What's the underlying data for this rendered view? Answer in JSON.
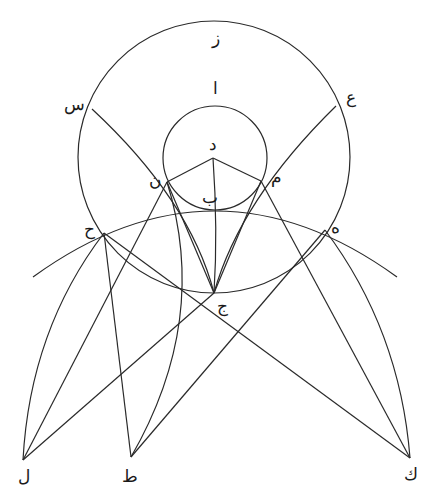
{
  "diagram": {
    "type": "geometric-construction",
    "stroke_color": "#2a2a2a",
    "background": "#ffffff",
    "points": {
      "Z": {
        "label": "ز",
        "x": 214,
        "y": 21,
        "lx": 216,
        "ly": 44
      },
      "A": {
        "label": "ا",
        "x": 215,
        "y": 106,
        "lx": 215,
        "ly": 94
      },
      "S": {
        "label": "س",
        "x": 92,
        "y": 109,
        "lx": 74,
        "ly": 110
      },
      "AYN": {
        "label": "ع",
        "x": 336,
        "y": 106,
        "lx": 351,
        "ly": 103
      },
      "D": {
        "label": "د",
        "x": 213,
        "y": 158,
        "lx": 213,
        "ly": 150
      },
      "N": {
        "label": "ن",
        "x": 167,
        "y": 182,
        "lx": 155,
        "ly": 186
      },
      "M": {
        "label": "م",
        "x": 261,
        "y": 181,
        "lx": 276,
        "ly": 183
      },
      "B": {
        "label": "ب",
        "x": 215,
        "y": 210,
        "lx": 210,
        "ly": 203
      },
      "H": {
        "label": "ح",
        "x": 104,
        "y": 233,
        "lx": 89,
        "ly": 235
      },
      "HE": {
        "label": "ه",
        "x": 325,
        "y": 230,
        "lx": 335,
        "ly": 233
      },
      "J": {
        "label": "ج",
        "x": 214,
        "y": 293,
        "lx": 222,
        "ly": 312
      },
      "L": {
        "label": "ل",
        "x": 23,
        "y": 460,
        "lx": 24,
        "ly": 482
      },
      "T": {
        "label": "ط",
        "x": 131,
        "y": 457,
        "lx": 130,
        "ly": 482
      },
      "K": {
        "label": "ك",
        "x": 410,
        "y": 458,
        "lx": 411,
        "ly": 480
      }
    },
    "circles": [
      {
        "name": "outer-circle",
        "cx": 214,
        "cy": 157,
        "r": 136
      },
      {
        "name": "inner-circle",
        "cx": 215,
        "cy": 158,
        "r": 52
      }
    ],
    "arcs": [
      {
        "name": "arc-big-horizontal",
        "d": "M33,277 Q215,145 397,277"
      },
      {
        "name": "arc-s-n-j",
        "d": "M92,109 Q190,200 214,293"
      },
      {
        "name": "arc-ayn-m-j",
        "d": "M336,106 Q240,200 214,293"
      },
      {
        "name": "arc-d-j",
        "d": "M213,158 Q218,230 214,293"
      },
      {
        "name": "arc-h-l",
        "d": "M104,233 Q30,330 23,460"
      },
      {
        "name": "arc-he-k",
        "d": "M325,230 Q400,330 410,458"
      },
      {
        "name": "arc-n-t",
        "d": "M167,182 Q210,320 131,457"
      }
    ],
    "segments": [
      {
        "name": "seg-d-n",
        "from": "D",
        "to": "N"
      },
      {
        "name": "seg-d-m",
        "from": "D",
        "to": "M"
      },
      {
        "name": "seg-n-l",
        "from": "N",
        "to": "L"
      },
      {
        "name": "seg-j-l",
        "from": "J",
        "to": "L"
      },
      {
        "name": "seg-h-t",
        "from": "H",
        "to": "T"
      },
      {
        "name": "seg-h-k",
        "from": "H",
        "to": "K"
      },
      {
        "name": "seg-he-t",
        "from": "HE",
        "to": "T"
      },
      {
        "name": "seg-m-k",
        "from": "M",
        "to": "K"
      },
      {
        "name": "seg-n-j",
        "from": "N",
        "to": "J"
      },
      {
        "name": "seg-m-j",
        "from": "M",
        "to": "J"
      }
    ]
  }
}
